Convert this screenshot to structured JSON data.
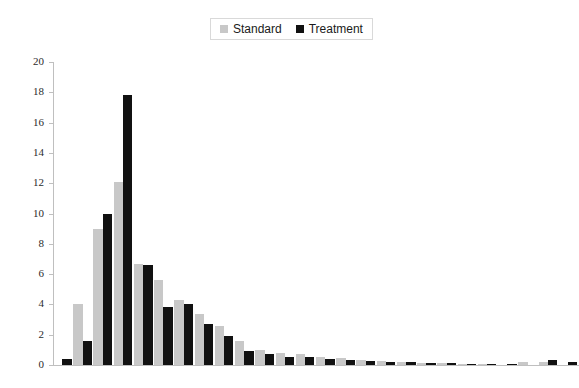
{
  "legend": {
    "position": "top-center",
    "entries": [
      {
        "label": "Standard",
        "color": "#c8c8c8",
        "swatch_name": "standard-swatch"
      },
      {
        "label": "Treatment",
        "color": "#111111",
        "swatch_name": "treatment-swatch"
      }
    ]
  },
  "axes": {
    "y_ticks": [
      "0",
      "2",
      "4",
      "6",
      "8",
      "10",
      "12",
      "14",
      "16",
      "18",
      "20"
    ],
    "y_min": 0,
    "y_max": 20,
    "y_step": 2,
    "x_labels_visible": false
  },
  "chart_data": {
    "type": "bar",
    "title": "",
    "subtitle": "",
    "xlabel": "",
    "ylabel": "",
    "ylim": [
      0,
      20
    ],
    "xlim": [
      0,
      26
    ],
    "grid": false,
    "legend_position": "top-center",
    "categories": [
      "1",
      "2",
      "3",
      "4",
      "5",
      "6",
      "7",
      "8",
      "9",
      "10",
      "11",
      "12",
      "13",
      "14",
      "15",
      "16",
      "17",
      "18",
      "19",
      "20",
      "21",
      "22",
      "23",
      "24",
      "25",
      "26"
    ],
    "series": [
      {
        "name": "Standard",
        "color": "#c8c8c8",
        "values": [
          0.0,
          4.0,
          9.0,
          12.1,
          6.7,
          5.6,
          4.3,
          3.4,
          2.6,
          1.6,
          1.0,
          0.8,
          0.7,
          0.55,
          0.45,
          0.35,
          0.25,
          0.2,
          0.15,
          0.12,
          0.1,
          0.08,
          0.0,
          0.18,
          0.22,
          0.0
        ]
      },
      {
        "name": "Treatment",
        "color": "#111111",
        "values": [
          0.4,
          1.6,
          10.0,
          17.8,
          6.6,
          3.8,
          4.0,
          2.7,
          1.9,
          0.9,
          0.7,
          0.55,
          0.5,
          0.4,
          0.32,
          0.28,
          0.22,
          0.18,
          0.15,
          0.12,
          0.1,
          0.08,
          0.06,
          0.0,
          0.3,
          0.18
        ]
      }
    ]
  }
}
